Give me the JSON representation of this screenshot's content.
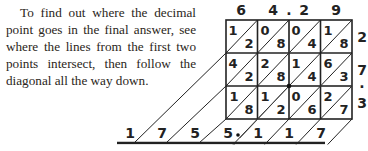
{
  "caption": "To find out where the decimal point goes in the final answer, see where the lines from the first two points intersect, then follow the diagonal all the way down.",
  "lattice": {
    "top_digits": [
      "6",
      "4",
      ".",
      "2",
      "9"
    ],
    "right_digits": [
      "2",
      "7",
      ".",
      "3"
    ],
    "cells": [
      [
        [
          "1",
          "2"
        ],
        [
          "0",
          "8"
        ],
        [
          "0",
          "4"
        ],
        [
          "1",
          "8"
        ]
      ],
      [
        [
          "4",
          "2"
        ],
        [
          "2",
          "8"
        ],
        [
          "1",
          "4"
        ],
        [
          "6",
          "3"
        ]
      ],
      [
        [
          "1",
          "8"
        ],
        [
          "1",
          "2"
        ],
        [
          "0",
          "6"
        ],
        [
          "2",
          "7"
        ]
      ]
    ],
    "answer_digits": [
      "1",
      "7",
      "5",
      "5",
      ".",
      "1",
      "1",
      "7"
    ]
  },
  "colors": {
    "ink": "#222222",
    "text": "#2a2520"
  }
}
